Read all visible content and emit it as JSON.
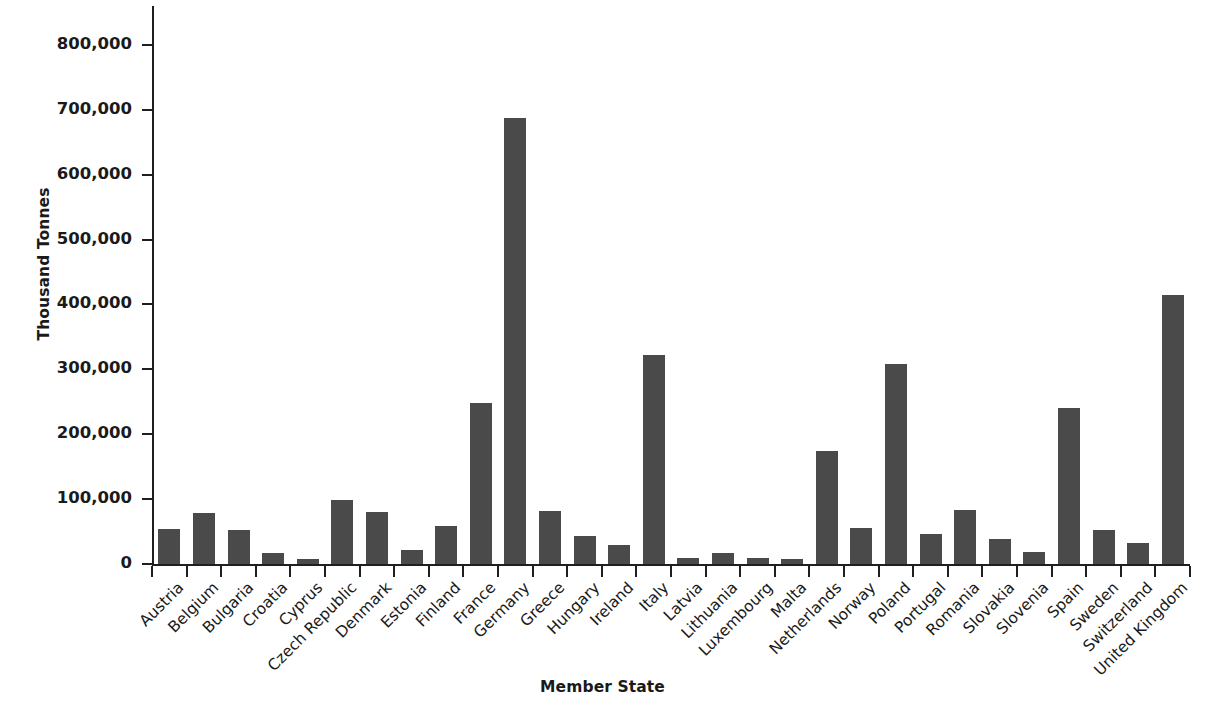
{
  "chart_data": {
    "type": "bar",
    "title": "",
    "xlabel": "Member State",
    "ylabel": "Thousand Tonnes",
    "ylim": [
      0,
      860000
    ],
    "ytick_labels": [
      "0",
      "100,000",
      "200,000",
      "300,000",
      "400,000",
      "500,000",
      "600,000",
      "700,000",
      "800,000"
    ],
    "ytick_values": [
      0,
      100000,
      200000,
      300000,
      400000,
      500000,
      600000,
      700000,
      800000
    ],
    "grid": false,
    "legend": false,
    "bar_color": "#4a4a4a",
    "categories": [
      "Austria",
      "Belgium",
      "Bulgaria",
      "Croatia",
      "Cyprus",
      "Czech Republic",
      "Denmark",
      "Estonia",
      "Finland",
      "France",
      "Germany",
      "Greece",
      "Hungary",
      "Ireland",
      "Italy",
      "Latvia",
      "Lithuania",
      "Luxembourg",
      "Malta",
      "Netherlands",
      "Norway",
      "Poland",
      "Portugal",
      "Romania",
      "Slovakia",
      "Slovenia",
      "Spain",
      "Sweden",
      "Switzerland",
      "United Kingdom"
    ],
    "values": [
      54000,
      78000,
      53000,
      17000,
      8000,
      98000,
      80000,
      21000,
      58000,
      248000,
      688000,
      82000,
      43000,
      30000,
      322000,
      9000,
      17000,
      9000,
      8000,
      174000,
      56000,
      308000,
      46000,
      84000,
      39000,
      18000,
      240000,
      52000,
      33000,
      414000
    ]
  }
}
